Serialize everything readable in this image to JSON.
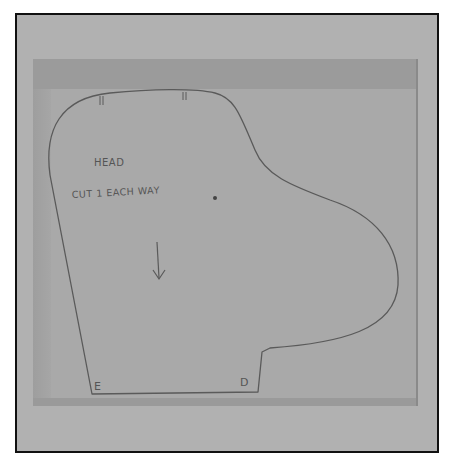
{
  "image": {
    "subject": "sewing pattern piece traced on paper",
    "colors": {
      "frame_border": "#111111",
      "frame_bg": "#b1b1b1",
      "paper": "#a9a9a9",
      "paper_band": "#9b9b9b",
      "pencil_line": "#5a5a5a"
    }
  },
  "pattern": {
    "title": "HEAD",
    "instruction": "CUT 1 EACH WAY",
    "dot": "•",
    "grainline": "down-arrow",
    "corner_labels": {
      "bottom_left": "E",
      "bottom_right": "D"
    },
    "notch_marks": [
      "||",
      "||"
    ]
  }
}
